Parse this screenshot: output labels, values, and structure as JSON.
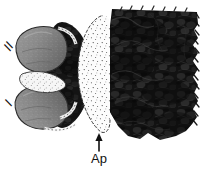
{
  "figure": {
    "kind": "halftone-anatomical-illustration",
    "background_color": "#ffffff",
    "width": 204,
    "height": 170,
    "labels": [
      {
        "id": "label-roman-two",
        "text": "II",
        "position": "upper-left",
        "rotation_deg": -55,
        "x": 10,
        "y": 52,
        "font_size": 13,
        "color": "#1a1a1a"
      },
      {
        "id": "label-roman-one",
        "text": "I",
        "position": "lower-left",
        "rotation_deg": -55,
        "x": 11,
        "y": 107,
        "font_size": 13,
        "color": "#1a1a1a"
      },
      {
        "id": "label-ap",
        "text": "Ap",
        "position": "bottom-center",
        "rotation_deg": 0,
        "x": 99,
        "y": 163,
        "font_size": 13,
        "color": "#111111"
      }
    ],
    "leader_arrow": {
      "id": "ap-arrow",
      "points_to": "pale-stippled-apodeme",
      "direction": "up",
      "x": 99,
      "y_tail": 151,
      "y_head": 134,
      "color": "#111111"
    },
    "regions": [
      {
        "id": "dark-right-mass",
        "description": "large dense dark textured mass with scalloped serrated right margin",
        "fill_color": "#151515",
        "texture": "mottled-halftone"
      },
      {
        "id": "pale-stippled-apodeme",
        "description": "pale lens-shaped stippled region with dashed outline",
        "fill_color": "#fbfbfb",
        "outline_color": "#3a3a3a",
        "texture": "stipple-dots"
      },
      {
        "id": "dark-middle-band",
        "description": "dark textured band left of the apodeme",
        "fill_color": "#161616",
        "texture": "mottled-halftone"
      },
      {
        "id": "grey-lobe-upper",
        "description": "rounded grey shaded lobe, upper left",
        "fill_color": "#8a8a8a",
        "shade_color": "#6e6e6e",
        "outline_color": "#2b2b2b"
      },
      {
        "id": "grey-lobe-lower",
        "description": "rounded grey shaded lobe, lower left",
        "fill_color": "#8a8a8a",
        "shade_color": "#6e6e6e",
        "outline_color": "#2b2b2b"
      },
      {
        "id": "white-wedge-middle",
        "description": "pale wedge separating the two grey lobes",
        "fill_color": "#f2f2f2",
        "outline_color": "#3a3a3a"
      }
    ]
  }
}
